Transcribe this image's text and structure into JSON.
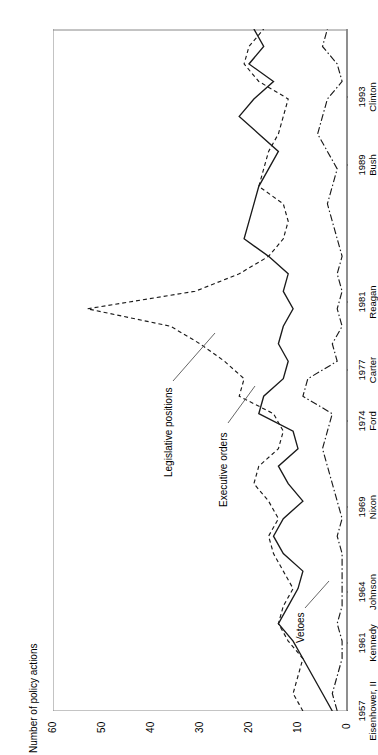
{
  "chart_data": {
    "type": "line",
    "title": "",
    "subtitle": "",
    "xlabel": "",
    "ylabel": "Number of policy actions",
    "ylim": [
      0,
      60
    ],
    "yticks": [
      0,
      10,
      20,
      30,
      40,
      50,
      60
    ],
    "grid": false,
    "legend_position": "inline-annotations",
    "orientation": "rotated-90",
    "x_tick_labels": [
      {
        "year": "1957",
        "president": "Eisenhower, II"
      },
      {
        "year": "1961",
        "president": "Kennedy"
      },
      {
        "year": "1964",
        "president": "Johnson"
      },
      {
        "year": "1969",
        "president": "Nixon"
      },
      {
        "year": "1974",
        "president": "Ford"
      },
      {
        "year": "1977",
        "president": "Carter"
      },
      {
        "year": "1981",
        "president": "Reagan"
      },
      {
        "year": "1989",
        "president": "Bush"
      },
      {
        "year": "1993",
        "president": "Clinton"
      }
    ],
    "x": [
      1957,
      1958,
      1959,
      1960,
      1961,
      1962,
      1963,
      1964,
      1965,
      1966,
      1967,
      1968,
      1969,
      1970,
      1971,
      1972,
      1973,
      1974,
      1975,
      1976,
      1977,
      1978,
      1979,
      1980,
      1981,
      1982,
      1983,
      1984,
      1985,
      1986,
      1987,
      1988,
      1989,
      1990,
      1991,
      1992,
      1993,
      1994,
      1995,
      1996
    ],
    "series": [
      {
        "name": "Legislative positions",
        "style": "dashed",
        "values": [
          9,
          11,
          10,
          9,
          12,
          14,
          13,
          11,
          13,
          15,
          16,
          14,
          16,
          19,
          18,
          14,
          13,
          15,
          22,
          21,
          25,
          30,
          36,
          53,
          31,
          22,
          16,
          13,
          12,
          13,
          18,
          17,
          16,
          14,
          13,
          12,
          18,
          21,
          20,
          17
        ]
      },
      {
        "name": "Executive orders",
        "style": "solid",
        "values": [
          3,
          5,
          7,
          9,
          11,
          14,
          12,
          10,
          9,
          13,
          15,
          13,
          9,
          12,
          14,
          10,
          11,
          18,
          17,
          13,
          12,
          14,
          13,
          11,
          13,
          12,
          16,
          21,
          20,
          19,
          18,
          16,
          14,
          18,
          22,
          19,
          15,
          20,
          17,
          19
        ]
      },
      {
        "name": "Vetoes",
        "style": "dash-dot",
        "values": [
          2,
          3,
          2,
          1,
          1,
          2,
          1,
          1,
          1,
          1,
          2,
          1,
          2,
          3,
          4,
          5,
          4,
          3,
          9,
          8,
          2,
          3,
          1,
          2,
          1,
          2,
          1,
          2,
          3,
          4,
          3,
          2,
          4,
          6,
          5,
          4,
          1,
          2,
          5,
          4
        ]
      }
    ],
    "annotations": [
      {
        "text": "Legislative positions",
        "points_to": "Legislative positions"
      },
      {
        "text": "Executive orders",
        "points_to": "Executive orders"
      },
      {
        "text": "Vetoes",
        "points_to": "Vetoes"
      }
    ],
    "colors": {
      "line": "#1a1a1a",
      "axis": "#555555",
      "background": "#ffffff"
    }
  }
}
